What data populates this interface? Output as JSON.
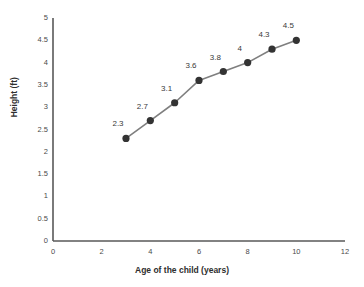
{
  "chart_data": {
    "type": "line",
    "title": "",
    "subtitle": "",
    "xlabel": "Age of the child (years)",
    "ylabel": "Height (ft)",
    "x": [
      3,
      4,
      5,
      6,
      7,
      8,
      9,
      10
    ],
    "values": [
      2.3,
      2.7,
      3.1,
      3.6,
      3.8,
      4,
      4.3,
      4.5
    ],
    "point_labels": [
      "2.3",
      "2.7",
      "3.1",
      "3.6",
      "3.8",
      "4",
      "4.3",
      "4.5"
    ],
    "xlim": [
      0,
      12
    ],
    "ylim": [
      0,
      5
    ],
    "x_ticks": [
      0,
      2,
      4,
      6,
      8,
      10,
      12
    ],
    "x_tick_labels": [
      "0",
      "2",
      "4",
      "6",
      "8",
      "10",
      "12"
    ],
    "y_ticks": [
      0,
      0.5,
      1,
      1.5,
      2,
      2.5,
      3,
      3.5,
      4,
      4.5,
      5
    ],
    "y_tick_labels": [
      "0",
      "0.5",
      "1",
      "1.5",
      "2",
      "2.5",
      "3",
      "3.5",
      "4",
      "4.5",
      "5"
    ],
    "grid": false,
    "legend": false,
    "legend_position": "none",
    "series": [
      {
        "name": "Height",
        "values": [
          2.3,
          2.7,
          3.1,
          3.6,
          3.8,
          4,
          4.3,
          4.5
        ],
        "line_color": "#7f7f7f",
        "marker_color": "#333333",
        "marker": "circle"
      }
    ],
    "colors": {
      "background": "#ffffff",
      "axis": "#595959",
      "line": "#7f7f7f",
      "marker": "#333333",
      "tick_text": "#4a4a4a",
      "title_text": "#2e2e2e"
    }
  }
}
